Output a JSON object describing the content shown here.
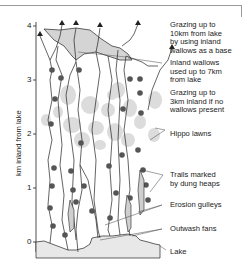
{
  "diagram": {
    "y_axis": {
      "label": "km inland from lake",
      "ticks": [
        "0",
        "1",
        "2",
        "3",
        "4"
      ]
    },
    "annotations": [
      {
        "id": "grazing-10km",
        "text": "Grazing up to\n10km from lake\nby using inland\nwallows as a base"
      },
      {
        "id": "inland-wallows",
        "text": "Inland wallows\nused up to 7km\nfrom lake"
      },
      {
        "id": "grazing-3km",
        "text": "Grazing up to\n3km inland if no\nwallows present"
      },
      {
        "id": "hippo-lawns",
        "text": "Hippo lawns"
      },
      {
        "id": "trails",
        "text": "Trails marked\nby dung heaps"
      },
      {
        "id": "erosion",
        "text": "Erosion gulleys"
      },
      {
        "id": "outwash",
        "text": "Outwash fans"
      },
      {
        "id": "lake",
        "text": "Lake"
      }
    ],
    "colors": {
      "lawn": "#d9d9d9",
      "wallow": "#d4d4d4",
      "lake": "#e6e6e6",
      "dung": "#555555",
      "line": "#222222"
    }
  }
}
